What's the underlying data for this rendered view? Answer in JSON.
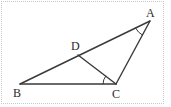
{
  "figure": {
    "kind": "geometry-diagram",
    "background_color": "#ffffff",
    "stroke_color": "#3a3a3a",
    "frame_color": "#c9c9c9",
    "width": 171,
    "height": 107
  },
  "points": {
    "A": {
      "label": "A",
      "x": 150,
      "y": 21,
      "label_x": 146,
      "label_y": 7
    },
    "B": {
      "label": "B",
      "x": 20,
      "y": 84,
      "label_x": 13,
      "label_y": 87
    },
    "C": {
      "label": "C",
      "x": 116,
      "y": 84,
      "label_x": 112,
      "label_y": 88
    },
    "D": {
      "label": "D",
      "x": 78,
      "y": 55,
      "label_x": 71,
      "label_y": 40
    }
  },
  "segments": [
    {
      "name": "segment-BA",
      "from": "B",
      "to": "A"
    },
    {
      "name": "segment-BC",
      "from": "B",
      "to": "C"
    },
    {
      "name": "segment-AC",
      "from": "A",
      "to": "C"
    },
    {
      "name": "segment-DC",
      "from": "D",
      "to": "C"
    }
  ],
  "angle_marks": [
    {
      "name": "angle-arc-A",
      "vertex": "A",
      "between": [
        "B",
        "C"
      ]
    },
    {
      "name": "angle-arc-C",
      "vertex": "C",
      "between": [
        "B",
        "D"
      ]
    }
  ]
}
